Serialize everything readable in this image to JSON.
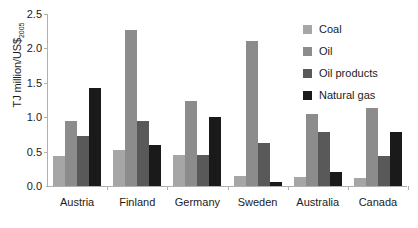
{
  "chart_data": {
    "type": "bar",
    "title": "",
    "xlabel": "",
    "ylabel": "TJ million/US$",
    "ylabel_subscript": "2005",
    "categories": [
      "Austria",
      "Finland",
      "Germany",
      "Sweden",
      "Australia",
      "Canada"
    ],
    "series": [
      {
        "name": "Coal",
        "color": "#a6a6a6",
        "values": [
          0.43,
          0.53,
          0.45,
          0.14,
          0.13,
          0.12
        ]
      },
      {
        "name": "Oil",
        "color": "#8c8c8c",
        "values": [
          0.95,
          2.27,
          1.23,
          2.11,
          1.04,
          1.14
        ]
      },
      {
        "name": "Oil products",
        "color": "#595959",
        "values": [
          0.72,
          0.95,
          0.45,
          0.62,
          0.78,
          0.44
        ]
      },
      {
        "name": "Natural gas",
        "color": "#1a1a1a",
        "values": [
          1.43,
          0.6,
          1.0,
          0.06,
          0.2,
          0.79
        ]
      }
    ],
    "ylim": [
      0,
      2.5
    ],
    "ytick_values": [
      0.0,
      0.5,
      1.0,
      1.5,
      2.0,
      2.5
    ],
    "ytick_labels": [
      "0.0",
      "0.5",
      "1.0",
      "1.5",
      "2.0",
      "2.5"
    ],
    "grid": false,
    "legend_position": "right",
    "legend_entries": [
      "Coal",
      "Oil",
      "Oil products",
      "Natural gas"
    ],
    "axis_color": "#b0b0b0",
    "text_color": "#1b1b1b",
    "background": "#ffffff"
  }
}
